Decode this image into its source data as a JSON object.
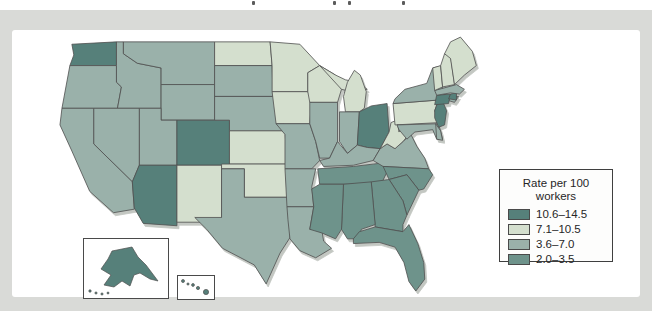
{
  "legend": {
    "title_lines": [
      "Rate per 100",
      "workers"
    ],
    "items": [
      {
        "key": "cat1",
        "label": "10.6–14.5",
        "color": "#56807a"
      },
      {
        "key": "cat2",
        "label": "7.1–10.5",
        "color": "#d4dfce"
      },
      {
        "key": "cat3",
        "label": "3.6–7.0",
        "color": "#9ab1aa"
      },
      {
        "key": "cat4",
        "label": "2.0–3.5",
        "color": "#6e938b"
      }
    ]
  },
  "map": {
    "state_categories": {
      "WA": "cat1",
      "OR": "cat3",
      "CA": "cat3",
      "NV": "cat3",
      "ID": "cat3",
      "MT": "cat3",
      "WY": "cat3",
      "UT": "cat3",
      "CO": "cat1",
      "AZ": "cat1",
      "NM": "cat2",
      "ND": "cat2",
      "SD": "cat3",
      "NE": "cat3",
      "KS": "cat2",
      "OK": "cat2",
      "TX": "cat3",
      "MN": "cat2",
      "IA": "cat2",
      "MO": "cat3",
      "AR": "cat3",
      "LA": "cat3",
      "WI": "cat2",
      "IL": "cat3",
      "MI": "cat2",
      "IN": "cat3",
      "OH": "cat1",
      "KY": "cat3",
      "TN": "cat4",
      "MS": "cat4",
      "AL": "cat4",
      "GA": "cat4",
      "FL": "cat4",
      "SC": "cat4",
      "NC": "cat4",
      "VA": "cat3",
      "WV": "cat2",
      "PA": "cat2",
      "NY": "cat3",
      "NJ": "cat1",
      "DE": "cat3",
      "MD": "cat3",
      "CT": "cat1",
      "RI": "cat1",
      "MA": "cat3",
      "VT": "cat2",
      "NH": "cat2",
      "ME": "cat2",
      "AK": "cat1",
      "HI": "cat1"
    }
  },
  "chart_data": {
    "type": "heatmap",
    "subtype": "us_state_choropleth",
    "legend_title": "Rate per 100 workers",
    "legend_position": "right",
    "bins": [
      {
        "label": "10.6–14.5",
        "range": [
          10.6,
          14.5
        ],
        "states": [
          "WA",
          "CO",
          "AZ",
          "OH",
          "NJ",
          "CT",
          "RI",
          "AK",
          "HI"
        ]
      },
      {
        "label": "7.1–10.5",
        "range": [
          7.1,
          10.5
        ],
        "states": [
          "NM",
          "ND",
          "KS",
          "OK",
          "MN",
          "IA",
          "WI",
          "MI",
          "WV",
          "PA",
          "VT",
          "NH",
          "ME"
        ]
      },
      {
        "label": "3.6–7.0",
        "range": [
          3.6,
          7.0
        ],
        "states": [
          "OR",
          "CA",
          "NV",
          "ID",
          "MT",
          "WY",
          "UT",
          "SD",
          "NE",
          "TX",
          "MO",
          "AR",
          "LA",
          "IL",
          "IN",
          "KY",
          "VA",
          "NY",
          "MA",
          "MD",
          "DE"
        ]
      },
      {
        "label": "2.0–3.5",
        "range": [
          2.0,
          3.5
        ],
        "states": [
          "TN",
          "NC",
          "SC",
          "GA",
          "AL",
          "MS",
          "FL"
        ]
      }
    ]
  }
}
